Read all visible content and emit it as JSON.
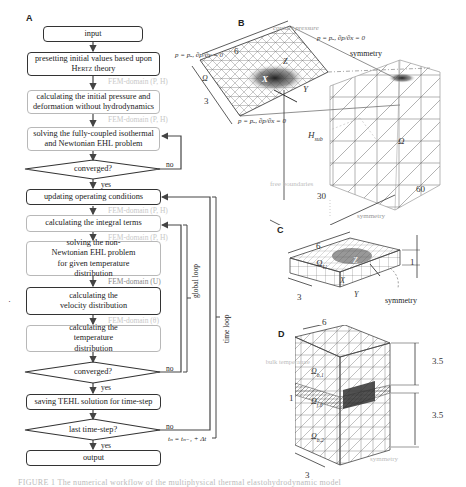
{
  "panels": {
    "a": {
      "letter": "A",
      "steps": {
        "input": "input",
        "preset_line1": "presetting initial values based upon",
        "preset_hertz": "Hertz",
        "preset_theory": " theory",
        "initial_calc": "calculating the initial pressure and deformation without hydrodynamics",
        "solve_iso": "solving the fully-coupled isothermal and Newtonian EHL problem",
        "converged1": "converged?",
        "update_ops": "updating operating conditions",
        "integral": "calculating the integral terms",
        "solve_nonnewt": "solving the non-Newtonian EHL problem for given temperature distribution",
        "velocity": "calculating the velocity distribution",
        "temperature": "calculating the temperature distribution",
        "converged2": "converged?",
        "saving": "saving TEHL solution for time-step",
        "last_step": "last time-step?",
        "output": "output"
      },
      "domains": {
        "d1": "FEM-domain (P, H)",
        "d2": "FEM-domain (P, H)",
        "d3": "FEM-domain (P, H)",
        "d4": "FEM-domain (P, H)",
        "d5": "FEM-domain (U)",
        "d6": "FEM-domain (θ)"
      },
      "labels": {
        "no1": "no",
        "yes1": "yes",
        "no2": "no",
        "yes2": "yes",
        "no3": "no",
        "yes3": "yes",
        "global_loop": "global loop",
        "time_loop": "time loop",
        "time_update": "tₙ = tₙ₋₁ + Δt"
      }
    },
    "b": {
      "letter": "B",
      "contact_pressure": "contact pressure",
      "bc_top": "p = pₐ, ∂p/∂x = 0",
      "bc_left": "p = pₐ, ∂p/∂y = 0",
      "bc_bottom": "p = pₐ, ∂p/∂x = 0",
      "symmetry_top": "symmetry",
      "symmetry_bottom": "symmetry",
      "free_boundaries": "free boundaries",
      "dim_6": "6",
      "dim_3": "3",
      "dim_30": "30",
      "dim_60": "60",
      "h_sub": "H",
      "h_sub_index": "sub",
      "omega": "Ω",
      "omega_small": "Ω",
      "x_label": "X",
      "y_label": "Y",
      "z_label": "Z"
    },
    "c": {
      "letter": "C",
      "dim_6": "6",
      "dim_3": "3",
      "dim_1": "1",
      "omega": "Ω",
      "omega_sub": "U",
      "x_label": "X",
      "y_label": "Y",
      "z_label": "Z",
      "symmetry": "symmetry"
    },
    "d": {
      "letter": "D",
      "dim_6": "6",
      "dim_3": "3",
      "dim_1": "1",
      "dim_35_top": "3.5",
      "dim_35_bottom": "3.5",
      "bulk_temperature": "bulk temperature",
      "omega_b1": "Ω",
      "omega_b1_sub": "b,1",
      "omega_b2": "Ω",
      "omega_b2_sub": "b,2",
      "omega_f": "Ω",
      "omega_f_sub": "f,θ",
      "symmetry": "symmetry"
    }
  },
  "caption": "FIGURE 1  The numerical workflow of the multiphysical thermal elastohydrodynamic model",
  "colors": {
    "dark_box": "#333333",
    "light_box": "#b8b8b8",
    "mesh": "#555555",
    "faint_label": "#c8c8c8"
  }
}
